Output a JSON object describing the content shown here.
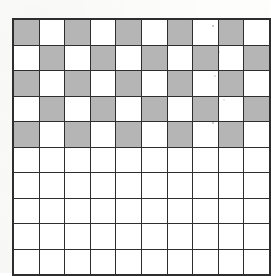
{
  "figure": {
    "grid": {
      "rows": 10,
      "columns": 10,
      "total_cells": 100,
      "shaded_cell_count": 25,
      "blank_cell_count": 75,
      "shaded_color": "#b5b5b5",
      "blank_color": "#ffffff",
      "line_color": "#2e2e2e",
      "background_color": "#fbfbfa",
      "cells": [
        [
          1,
          0,
          1,
          0,
          1,
          0,
          1,
          0,
          1,
          0
        ],
        [
          0,
          1,
          0,
          1,
          0,
          1,
          0,
          1,
          0,
          1
        ],
        [
          1,
          0,
          1,
          0,
          1,
          0,
          1,
          0,
          1,
          0
        ],
        [
          0,
          1,
          0,
          1,
          0,
          1,
          0,
          1,
          0,
          1
        ],
        [
          1,
          0,
          1,
          0,
          1,
          0,
          1,
          0,
          1,
          0
        ],
        [
          0,
          0,
          0,
          0,
          0,
          0,
          0,
          0,
          0,
          0
        ],
        [
          0,
          0,
          0,
          0,
          0,
          0,
          0,
          0,
          0,
          0
        ],
        [
          0,
          0,
          0,
          0,
          0,
          0,
          0,
          0,
          0,
          0
        ],
        [
          0,
          0,
          0,
          0,
          0,
          0,
          0,
          0,
          0,
          0
        ],
        [
          0,
          0,
          0,
          0,
          0,
          0,
          0,
          0,
          0,
          0
        ]
      ]
    }
  }
}
